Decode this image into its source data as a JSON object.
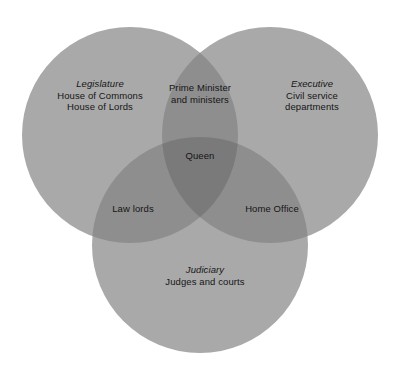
{
  "diagram": {
    "type": "venn",
    "set_count": 3,
    "background_color": "#ffffff",
    "text_color": "#151515",
    "fill_base_color": "#a9a9a9",
    "fill_pair_color": "#8e8e8e",
    "fill_triple_color": "#7a7a7a",
    "sets": [
      {
        "id": "legislature",
        "title": "Legislature",
        "lines": [
          "House of Commons",
          "House of Lords"
        ],
        "center": [
          130,
          135
        ],
        "radius": 108
      },
      {
        "id": "executive",
        "title": "Executive",
        "lines": [
          "Civil service",
          "departments"
        ],
        "center": [
          270,
          135
        ],
        "radius": 108
      },
      {
        "id": "judiciary",
        "title": "Judiciary",
        "lines": [
          "Judges and courts"
        ],
        "center": [
          200,
          245
        ],
        "radius": 108
      }
    ],
    "intersections": [
      {
        "id": "legislature-executive",
        "lines": [
          "Prime Minister",
          "and ministers"
        ],
        "sets": [
          "legislature",
          "executive"
        ]
      },
      {
        "id": "legislature-judiciary",
        "lines": [
          "Law lords"
        ],
        "sets": [
          "legislature",
          "judiciary"
        ]
      },
      {
        "id": "executive-judiciary",
        "lines": [
          "Home Office"
        ],
        "sets": [
          "executive",
          "judiciary"
        ]
      },
      {
        "id": "all-three",
        "lines": [
          "Queen"
        ],
        "sets": [
          "legislature",
          "executive",
          "judiciary"
        ]
      }
    ]
  }
}
